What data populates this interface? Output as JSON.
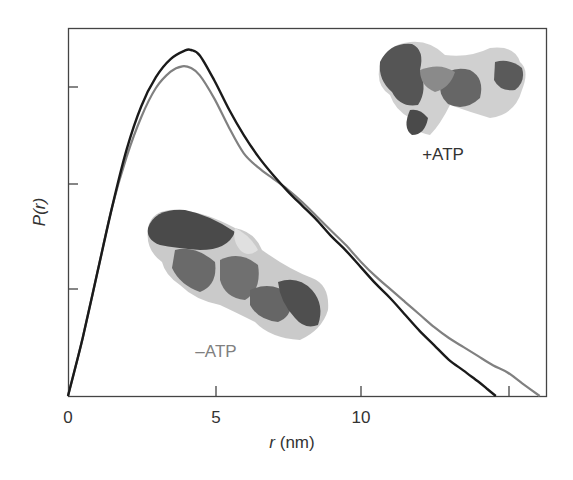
{
  "chart_data": {
    "type": "line",
    "title": "",
    "xlabel": "r (nm)",
    "xlabel_italic": "r",
    "xlabel_unit": "(nm)",
    "ylabel": "P(r)",
    "xlim": [
      0,
      16.3
    ],
    "ylim": [
      0,
      1.0
    ],
    "x_ticks": [
      0,
      5,
      10,
      15
    ],
    "x_tick_labels": [
      "0",
      "5",
      "10",
      ""
    ],
    "y_ticks_count": 3,
    "y_tick_labels": [
      "",
      "",
      ""
    ],
    "grid": false,
    "legend": "none (inline annotations)",
    "series": [
      {
        "name": "+ATP",
        "color": "#1a1a1a",
        "x": [
          0,
          0.5,
          1.0,
          1.5,
          2.0,
          2.5,
          3.0,
          3.5,
          4.0,
          4.2,
          4.5,
          5.0,
          5.5,
          6.0,
          6.5,
          7.0,
          7.5,
          8.0,
          8.5,
          9.0,
          9.5,
          10.0,
          10.5,
          11.0,
          11.5,
          12.0,
          12.5,
          13.0,
          13.5,
          14.0,
          14.3,
          14.6
        ],
        "values": [
          0,
          0.16,
          0.34,
          0.52,
          0.68,
          0.8,
          0.88,
          0.93,
          0.954,
          0.955,
          0.94,
          0.87,
          0.79,
          0.72,
          0.66,
          0.61,
          0.565,
          0.525,
          0.485,
          0.44,
          0.4,
          0.355,
          0.31,
          0.27,
          0.225,
          0.18,
          0.14,
          0.1,
          0.07,
          0.04,
          0.02,
          0.0
        ]
      },
      {
        "name": "-ATP",
        "color": "#808080",
        "x": [
          0,
          0.5,
          1.0,
          1.5,
          2.0,
          2.5,
          3.0,
          3.5,
          3.9,
          4.2,
          4.5,
          5.0,
          5.5,
          6.0,
          6.5,
          7.0,
          7.5,
          8.0,
          8.5,
          9.0,
          9.5,
          10.0,
          10.5,
          11.0,
          11.5,
          12.0,
          12.5,
          13.0,
          13.5,
          14.0,
          14.5,
          15.0,
          15.5,
          16.1
        ],
        "values": [
          0,
          0.16,
          0.34,
          0.52,
          0.66,
          0.77,
          0.85,
          0.895,
          0.91,
          0.905,
          0.885,
          0.82,
          0.74,
          0.67,
          0.63,
          0.6,
          0.57,
          0.535,
          0.495,
          0.455,
          0.415,
          0.37,
          0.33,
          0.295,
          0.26,
          0.225,
          0.19,
          0.16,
          0.135,
          0.11,
          0.085,
          0.065,
          0.035,
          0.0
        ]
      }
    ],
    "annotations": [
      {
        "text": "+ATP",
        "near": "upper right molecular envelope",
        "color": "#333333"
      },
      {
        "text": "–ATP",
        "near": "lower left molecular envelope",
        "color": "#808080"
      }
    ]
  },
  "labels": {
    "ylabel": "P(r)",
    "xlabel_r": "r",
    "xlabel_unit": " (nm)",
    "plus_atp": "+ATP",
    "minus_atp": "–ATP",
    "x0": "0",
    "x5": "5",
    "x10": "10"
  },
  "colors": {
    "plus_atp_line": "#1a1a1a",
    "minus_atp_line": "#808080",
    "axis": "#444444"
  }
}
